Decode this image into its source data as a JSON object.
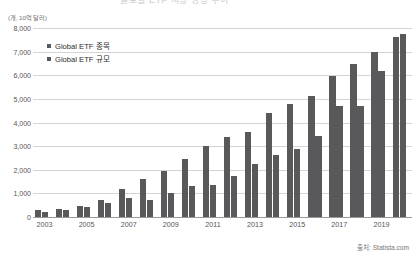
{
  "header": {
    "clipped_title": "글로벌 ETF 시장 성장 추이"
  },
  "source": "출처: Statista.com",
  "chart_data": {
    "type": "bar",
    "title": "",
    "subtitle": "",
    "unit_caption": "(개, 10억 달러)",
    "xlabel": "",
    "ylabel": "",
    "ylim": [
      0,
      8000
    ],
    "ytick_step": 1000,
    "grid": true,
    "legend_position": "top-left",
    "categories": [
      "2003",
      "2004",
      "2005",
      "2006",
      "2007",
      "2008",
      "2009",
      "2010",
      "2011",
      "2012",
      "2013",
      "2014",
      "2015",
      "2016",
      "2017",
      "2018",
      "2019",
      "2020"
    ],
    "xtick_labels": [
      "2003",
      "2005",
      "2007",
      "2009",
      "2011",
      "2013",
      "2015",
      "2017",
      "2019"
    ],
    "yticks": [
      "0",
      "1,000",
      "2,000",
      "3,000",
      "4,000",
      "5,000",
      "6,000",
      "7,000",
      "8,000"
    ],
    "series": [
      {
        "name": "Global ETF 종목",
        "color": "#59595c",
        "values": [
          276,
          336,
          453,
          713,
          1171,
          1595,
          1944,
          2460,
          3019,
          3391,
          3585,
          4396,
          4778,
          5116,
          5974,
          6478,
          6970,
          7602
        ]
      },
      {
        "name": "Global ETF 규모",
        "color": "#59595c",
        "values": [
          204,
          310,
          417,
          580,
          807,
          716,
          1036,
          1313,
          1355,
          1754,
          2254,
          2643,
          2868,
          3422,
          4690,
          4685,
          6181,
          7736
        ]
      }
    ]
  }
}
